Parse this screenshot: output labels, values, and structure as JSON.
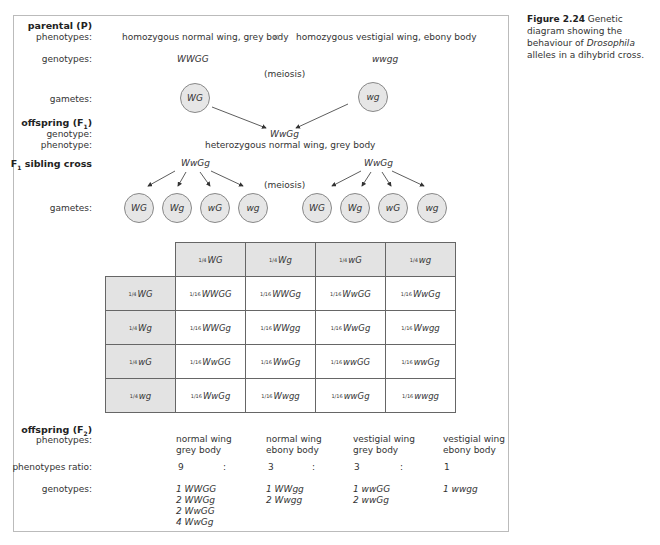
{
  "caption": {
    "figure_number": "Figure 2.24",
    "text_before_italic": "Genetic diagram showing the behaviour of",
    "italic": "Drosophila",
    "text_after_italic": "alleles in a dihybrid cross."
  },
  "parental": {
    "heading": "parental (P)",
    "phenotypes_label": "phenotypes:",
    "genotypes_label": "genotypes:",
    "gametes_label": "gametes:",
    "parent1_phenotype": "homozygous normal wing, grey body",
    "cross_symbol": "×",
    "parent2_phenotype": "homozygous vestigial wing, ebony body",
    "parent1_genotype": "WWGG",
    "parent2_genotype": "wwgg",
    "meiosis": "(meiosis)",
    "parent1_gamete": "WG",
    "parent2_gamete": "wg"
  },
  "f1": {
    "heading": "offspring (F",
    "heading_sub": "1",
    "heading_close": ")",
    "genotype_label": "genotype:",
    "phenotype_label": "phenotype:",
    "genotype": "WwGg",
    "phenotype": "heterozygous normal wing, grey body"
  },
  "sibling_cross": {
    "heading": "F",
    "heading_sub": "1",
    "heading_rest": " sibling cross",
    "left_parent": "WwGg",
    "right_parent": "WwGg",
    "meiosis": "(meiosis)",
    "gametes_label": "gametes:",
    "left_gametes": [
      "WG",
      "Wg",
      "wG",
      "wg"
    ],
    "right_gametes": [
      "WG",
      "Wg",
      "wG",
      "wg"
    ]
  },
  "punnett": {
    "col_headers": [
      {
        "frac": "1/4",
        "g": "WG"
      },
      {
        "frac": "1/4",
        "g": "Wg"
      },
      {
        "frac": "1/4",
        "g": "wG"
      },
      {
        "frac": "1/4",
        "g": "wg"
      }
    ],
    "rows": [
      {
        "header": {
          "frac": "1/4",
          "g": "WG"
        },
        "cells": [
          {
            "frac": "1/16",
            "g": "WWGG"
          },
          {
            "frac": "1/16",
            "g": "WWGg"
          },
          {
            "frac": "1/16",
            "g": "WwGG"
          },
          {
            "frac": "1/16",
            "g": "WwGg"
          }
        ]
      },
      {
        "header": {
          "frac": "1/4",
          "g": "Wg"
        },
        "cells": [
          {
            "frac": "1/16",
            "g": "WWGg"
          },
          {
            "frac": "1/16",
            "g": "WWgg"
          },
          {
            "frac": "1/16",
            "g": "WwGg"
          },
          {
            "frac": "1/16",
            "g": "Wwgg"
          }
        ]
      },
      {
        "header": {
          "frac": "1/4",
          "g": "wG"
        },
        "cells": [
          {
            "frac": "1/16",
            "g": "WwGG"
          },
          {
            "frac": "1/16",
            "g": "WwGg"
          },
          {
            "frac": "1/16",
            "g": "wwGG"
          },
          {
            "frac": "1/16",
            "g": "wwGg"
          }
        ]
      },
      {
        "header": {
          "frac": "1/4",
          "g": "wg"
        },
        "cells": [
          {
            "frac": "1/16",
            "g": "WwGg"
          },
          {
            "frac": "1/16",
            "g": "Wwgg"
          },
          {
            "frac": "1/16",
            "g": "wwGg"
          },
          {
            "frac": "1/16",
            "g": "wwgg"
          }
        ]
      }
    ]
  },
  "f2": {
    "heading": "offspring (F",
    "heading_sub": "2",
    "heading_close": ")",
    "phenotypes_label": "phenotypes:",
    "ratio_label": "phenotypes ratio:",
    "genotypes_label": "genotypes:",
    "ratio_separator": ":",
    "classes": [
      {
        "line1": "normal wing",
        "line2": "grey body",
        "ratio": "9",
        "genotypes": [
          "1 WWGG",
          "2 WWGg",
          "2 WwGG",
          "4 WwGg"
        ]
      },
      {
        "line1": "normal wing",
        "line2": "ebony body",
        "ratio": "3",
        "genotypes": [
          "1 WWgg",
          "2 Wwgg"
        ]
      },
      {
        "line1": "vestigial wing",
        "line2": "grey body",
        "ratio": "3",
        "genotypes": [
          "1 wwGG",
          "2 wwGg"
        ]
      },
      {
        "line1": "vestigial wing",
        "line2": "ebony body",
        "ratio": "1",
        "genotypes": [
          "1 wwgg"
        ]
      }
    ]
  }
}
